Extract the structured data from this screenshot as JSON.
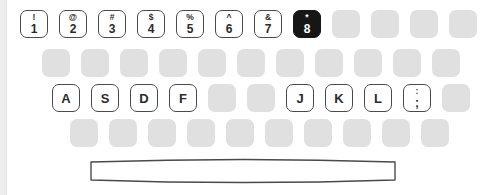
{
  "widget": {
    "name": "on-screen-keyboard",
    "width": 480,
    "height": 195,
    "background_color": "#ffffff"
  },
  "theme": {
    "blank_key_color": "#e0e0e0",
    "labeled_key_face": "#ffffff",
    "labeled_key_outline": "#4a4a4a",
    "active_key_background": "#161616",
    "active_key_text": "#ffffff",
    "legend_text_color": "#2b2b2b",
    "edge_band_color": "#ededed"
  },
  "state": {
    "active_key_id": "digit-8",
    "active_key_top_legend": "*",
    "active_key_bottom_legend": "8"
  },
  "rows": [
    {
      "id": "number-row",
      "name": "row-number",
      "keys": [
        {
          "id": "digit-1",
          "top": "!",
          "bottom": "1",
          "style": "labeled"
        },
        {
          "id": "digit-2",
          "top": "@",
          "bottom": "2",
          "style": "labeled"
        },
        {
          "id": "digit-3",
          "top": "#",
          "bottom": "3",
          "style": "labeled"
        },
        {
          "id": "digit-4",
          "top": "$",
          "bottom": "4",
          "style": "labeled"
        },
        {
          "id": "digit-5",
          "top": "%",
          "bottom": "5",
          "style": "labeled"
        },
        {
          "id": "digit-6",
          "top": "^",
          "bottom": "6",
          "style": "labeled"
        },
        {
          "id": "digit-7",
          "top": "&",
          "bottom": "7",
          "style": "labeled"
        },
        {
          "id": "digit-8",
          "top": "*",
          "bottom": "8",
          "style": "active"
        },
        {
          "id": "number-blank-1",
          "top": "",
          "bottom": "",
          "style": "blank"
        },
        {
          "id": "number-blank-2",
          "top": "",
          "bottom": "",
          "style": "blank"
        },
        {
          "id": "number-blank-3",
          "top": "",
          "bottom": "",
          "style": "blank"
        },
        {
          "id": "number-blank-4",
          "top": "",
          "bottom": "",
          "style": "blank"
        }
      ]
    },
    {
      "id": "upper-row",
      "name": "row-upper",
      "keys": [
        {
          "id": "upper-blank-1",
          "top": "",
          "bottom": "",
          "style": "blank"
        },
        {
          "id": "upper-blank-2",
          "top": "",
          "bottom": "",
          "style": "blank"
        },
        {
          "id": "upper-blank-3",
          "top": "",
          "bottom": "",
          "style": "blank"
        },
        {
          "id": "upper-blank-4",
          "top": "",
          "bottom": "",
          "style": "blank"
        },
        {
          "id": "upper-blank-5",
          "top": "",
          "bottom": "",
          "style": "blank"
        },
        {
          "id": "upper-blank-6",
          "top": "",
          "bottom": "",
          "style": "blank"
        },
        {
          "id": "upper-blank-7",
          "top": "",
          "bottom": "",
          "style": "blank"
        },
        {
          "id": "upper-blank-8",
          "top": "",
          "bottom": "",
          "style": "blank"
        },
        {
          "id": "upper-blank-9",
          "top": "",
          "bottom": "",
          "style": "blank"
        },
        {
          "id": "upper-blank-10",
          "top": "",
          "bottom": "",
          "style": "blank"
        },
        {
          "id": "upper-blank-11",
          "top": "",
          "bottom": "",
          "style": "blank"
        }
      ]
    },
    {
      "id": "home-row",
      "name": "row-home",
      "keys": [
        {
          "id": "letter-a",
          "top": "",
          "bottom": "A",
          "style": "labeled single"
        },
        {
          "id": "letter-s",
          "top": "",
          "bottom": "S",
          "style": "labeled single"
        },
        {
          "id": "letter-d",
          "top": "",
          "bottom": "D",
          "style": "labeled single"
        },
        {
          "id": "letter-f",
          "top": "",
          "bottom": "F",
          "style": "labeled single"
        },
        {
          "id": "home-blank-1",
          "top": "",
          "bottom": "",
          "style": "blank"
        },
        {
          "id": "home-blank-2",
          "top": "",
          "bottom": "",
          "style": "blank"
        },
        {
          "id": "letter-j",
          "top": "",
          "bottom": "J",
          "style": "labeled single"
        },
        {
          "id": "letter-k",
          "top": "",
          "bottom": "K",
          "style": "labeled single"
        },
        {
          "id": "letter-l",
          "top": "",
          "bottom": "L",
          "style": "labeled single"
        },
        {
          "id": "semicolon",
          "top": ":",
          "bottom": ";",
          "style": "labeled"
        },
        {
          "id": "home-blank-3",
          "top": "",
          "bottom": "",
          "style": "blank"
        }
      ]
    },
    {
      "id": "lower-row",
      "name": "row-lower",
      "keys": [
        {
          "id": "lower-blank-1",
          "top": "",
          "bottom": "",
          "style": "blank"
        },
        {
          "id": "lower-blank-2",
          "top": "",
          "bottom": "",
          "style": "blank"
        },
        {
          "id": "lower-blank-3",
          "top": "",
          "bottom": "",
          "style": "blank"
        },
        {
          "id": "lower-blank-4",
          "top": "",
          "bottom": "",
          "style": "blank"
        },
        {
          "id": "lower-blank-5",
          "top": "",
          "bottom": "",
          "style": "blank"
        },
        {
          "id": "lower-blank-6",
          "top": "",
          "bottom": "",
          "style": "blank"
        },
        {
          "id": "lower-blank-7",
          "top": "",
          "bottom": "",
          "style": "blank"
        },
        {
          "id": "lower-blank-8",
          "top": "",
          "bottom": "",
          "style": "blank"
        },
        {
          "id": "lower-blank-9",
          "top": "",
          "bottom": "",
          "style": "blank"
        },
        {
          "id": "lower-blank-10",
          "top": "",
          "bottom": "",
          "style": "blank"
        }
      ]
    }
  ],
  "space_bar": {
    "id": "space-bar",
    "label": "",
    "style": "outlined-barrel"
  }
}
